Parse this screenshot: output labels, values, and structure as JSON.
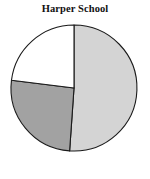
{
  "chart_data": {
    "type": "pie",
    "title": "Harper School",
    "xlabel": "",
    "ylabel": "",
    "legend": "none",
    "grid": false,
    "labels": [
      "Slice 1",
      "Slice 2",
      "Slice 3"
    ],
    "values": [
      51,
      26,
      23
    ],
    "units": "percent",
    "start_angle_deg": 0,
    "direction": "clockwise",
    "slice_angles_deg": [
      184,
      93,
      83
    ],
    "slices": [
      {
        "label": "Slice 1",
        "value": 51,
        "angle_deg": 184,
        "start_deg": 0,
        "end_deg": 184,
        "color": "#d4d4d4",
        "position": "right"
      },
      {
        "label": "Slice 2",
        "value": 26,
        "angle_deg": 93,
        "start_deg": 184,
        "end_deg": 277,
        "color": "#a2a2a2",
        "position": "bottom-left"
      },
      {
        "label": "Slice 3",
        "value": 23,
        "angle_deg": 83,
        "start_deg": 277,
        "end_deg": 360,
        "color": "#ffffff",
        "position": "top-left"
      }
    ],
    "geometry": {
      "center_x": 74,
      "center_y": 88,
      "radius": 63
    },
    "colors": {
      "outline": "#1a1a1a",
      "background": "#ffffff",
      "title_color": "#111111"
    }
  }
}
